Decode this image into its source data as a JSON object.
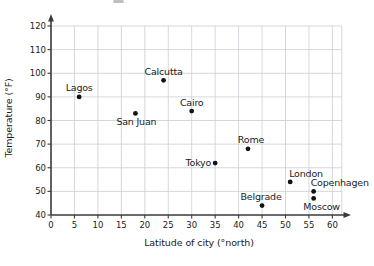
{
  "chart_data": {
    "type": "scatter",
    "title": "",
    "xlabel": "Latitude of city (°north)",
    "ylabel": "Temperature (°F)",
    "xlim": [
      0,
      62
    ],
    "ylim": [
      40,
      124
    ],
    "xticks": [
      0,
      5,
      10,
      15,
      20,
      25,
      30,
      35,
      40,
      45,
      50,
      55,
      60
    ],
    "yticks": [
      40,
      50,
      60,
      70,
      80,
      90,
      100,
      110,
      120
    ],
    "grid": true,
    "legend": false,
    "points": [
      {
        "city": "Lagos",
        "lat": 6,
        "temp": 90,
        "label_pos": "above",
        "label_dx": 0
      },
      {
        "city": "San Juan",
        "lat": 18,
        "temp": 83,
        "label_pos": "below",
        "label_dx": 1
      },
      {
        "city": "Calcutta",
        "lat": 24,
        "temp": 97,
        "label_pos": "above",
        "label_dx": 0
      },
      {
        "city": "Cairo",
        "lat": 30,
        "temp": 84,
        "label_pos": "above",
        "label_dx": 0
      },
      {
        "city": "Tokyo",
        "lat": 35,
        "temp": 62,
        "label_pos": "left",
        "label_dx": 0
      },
      {
        "city": "Rome",
        "lat": 42,
        "temp": 68,
        "label_pos": "above",
        "label_dx": 3
      },
      {
        "city": "Belgrade",
        "lat": 45,
        "temp": 44,
        "label_pos": "above",
        "label_dx": -1
      },
      {
        "city": "London",
        "lat": 51,
        "temp": 54,
        "label_pos": "above-right",
        "label_dx": -1
      },
      {
        "city": "Copenhagen",
        "lat": 56,
        "temp": 50,
        "label_pos": "above-right",
        "label_dx": -3
      },
      {
        "city": "Moscow",
        "lat": 56,
        "temp": 47,
        "label_pos": "below",
        "label_dx": 8
      }
    ]
  },
  "style": {
    "dot_color": "#121212",
    "grid_color": "#c9ced3",
    "axis_color": "#3a3a3a",
    "text_color": "#1b1b1b",
    "background": "#ffffff"
  }
}
